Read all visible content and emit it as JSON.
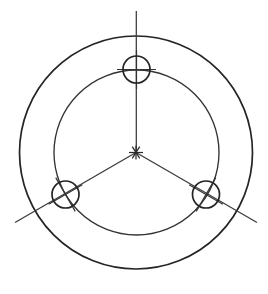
{
  "drawing": {
    "title": "Flange bolt circle plan view",
    "view_type": "engineering-line-drawing",
    "canvas": {
      "width": 268,
      "height": 294
    },
    "background_color": "#ffffff",
    "line_color": "#242424",
    "centerline_color": "#3a3a3a",
    "center": {
      "x": 136,
      "y": 152.5
    },
    "outer_circle": {
      "name": "outer-rim",
      "cx": 136,
      "cy": 152.5,
      "r": 116.5,
      "stroke_width": 1.7
    },
    "bolt_circle": {
      "name": "bolt-pitch-circle",
      "cx": 136.5,
      "cy": 152.5,
      "r": 82.5,
      "stroke_width": 1.35
    },
    "holes": [
      {
        "name": "hole-top",
        "cx": 136.5,
        "cy": 69.5,
        "r": 13.5,
        "angle_deg": 90
      },
      {
        "name": "hole-bottom-left",
        "cx": 65.5,
        "cy": 194.5,
        "r": 13.5,
        "angle_deg": 210
      },
      {
        "name": "hole-bottom-right",
        "cx": 206.0,
        "cy": 194.5,
        "r": 13.5,
        "angle_deg": 330
      }
    ],
    "hole_count": 3,
    "hole_spacing_deg": 120,
    "centerlines": [
      {
        "name": "centerline-vertical",
        "x1": 136.3,
        "y1": 11,
        "x2": 136.3,
        "y2": 152.5,
        "angle_deg": 90
      },
      {
        "name": "centerline-lower-left",
        "x1": 136,
        "y1": 152.5,
        "x2": 15,
        "y2": 222.5,
        "angle_deg": 210
      },
      {
        "name": "centerline-lower-right",
        "x1": 136,
        "y1": 152.5,
        "x2": 257,
        "y2": 222.5,
        "angle_deg": 330
      }
    ],
    "center_mark": {
      "name": "center-asterisk",
      "cx": 136,
      "cy": 152.5,
      "arm_length": 7,
      "symbol": "asterisk"
    },
    "hole_crossmarks": {
      "name": "hole-crosshair",
      "arm_overhang": 6,
      "description": "perpendicular crosshair aligned to each hole radial axis"
    }
  }
}
